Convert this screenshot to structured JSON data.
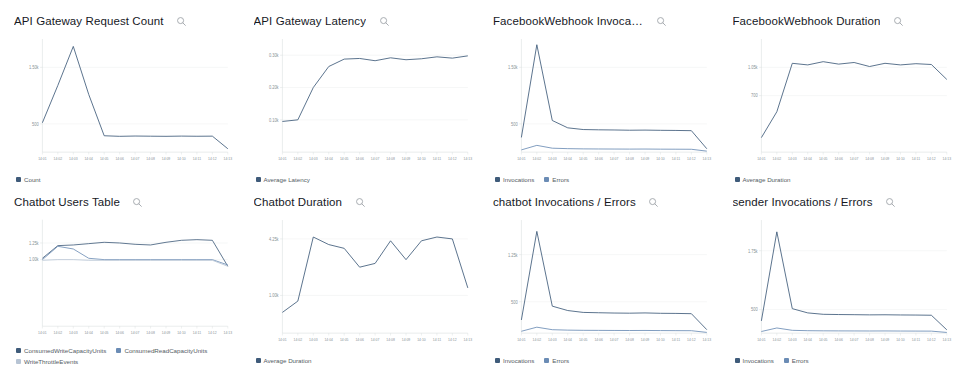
{
  "dashboard": {
    "search_icon": "search-icon",
    "palette": {
      "series1": "#3f5b7a",
      "series2": "#6b8cb5",
      "series3": "#b7c4d4",
      "legend_text": "#545b64",
      "gridline": "#eaeded",
      "axis_text": "#879196"
    },
    "widgets": [
      {
        "title": "API Gateway Request Count",
        "legend": [
          {
            "label": "Count",
            "color": "#3f5b7a"
          }
        ],
        "chart_data": {
          "type": "line",
          "title": "API Gateway Request Count",
          "xlabel": "",
          "ylabel": "",
          "grid": true,
          "legend_position": "bottom",
          "ylim": [
            0,
            2000
          ],
          "yticks": [
            500,
            1500
          ],
          "yticklabels": [
            "500",
            "1.50k"
          ],
          "x": [
            "14:01",
            "14:02",
            "14:03",
            "14:04",
            "14:05",
            "14:06",
            "14:07",
            "14:08",
            "14:09",
            "14:10",
            "14:11",
            "14:12",
            "14:13"
          ],
          "series": [
            {
              "name": "Count",
              "color": "#3f5b7a",
              "values": [
                520,
                1180,
                1870,
                1020,
                290,
                280,
                285,
                282,
                280,
                284,
                281,
                283,
                60
              ]
            }
          ]
        }
      },
      {
        "title": "API Gateway Latency",
        "legend": [
          {
            "label": "Average Latency",
            "color": "#3f5b7a"
          }
        ],
        "chart_data": {
          "type": "line",
          "title": "API Gateway Latency",
          "xlabel": "",
          "ylabel": "",
          "grid": true,
          "legend_position": "bottom",
          "ylim": [
            0,
            0.35
          ],
          "yticks": [
            0.1,
            0.2,
            0.3
          ],
          "yticklabels": [
            "0.10k",
            "0.20k",
            "0.30k"
          ],
          "x": [
            "14:01",
            "14:02",
            "14:03",
            "14:04",
            "14:05",
            "14:06",
            "14:07",
            "14:08",
            "14:09",
            "14:10",
            "14:11",
            "14:12",
            "14:13"
          ],
          "series": [
            {
              "name": "Average Latency",
              "color": "#3f5b7a",
              "values": [
                0.095,
                0.1,
                0.2,
                0.265,
                0.288,
                0.29,
                0.283,
                0.292,
                0.286,
                0.289,
                0.295,
                0.291,
                0.298
              ]
            }
          ]
        }
      },
      {
        "title": "FacebookWebhook Invocations / ...",
        "legend": [
          {
            "label": "Invocations",
            "color": "#3f5b7a"
          },
          {
            "label": "Errors",
            "color": "#6b8cb5"
          }
        ],
        "chart_data": {
          "type": "line",
          "title": "FacebookWebhook Invocations / Errors",
          "xlabel": "",
          "ylabel": "",
          "grid": true,
          "legend_position": "bottom",
          "ylim": [
            0,
            2000
          ],
          "yticks": [
            500,
            1500
          ],
          "yticklabels": [
            "500",
            "1.50k"
          ],
          "x": [
            "14:01",
            "14:02",
            "14:03",
            "14:04",
            "14:05",
            "14:06",
            "14:07",
            "14:08",
            "14:09",
            "14:10",
            "14:11",
            "14:12",
            "14:13"
          ],
          "series": [
            {
              "name": "Invocations",
              "color": "#3f5b7a",
              "values": [
                260,
                1900,
                560,
                430,
                400,
                395,
                392,
                388,
                390,
                386,
                384,
                380,
                60
              ]
            },
            {
              "name": "Errors",
              "color": "#6b8cb5",
              "values": [
                40,
                120,
                70,
                62,
                58,
                56,
                55,
                54,
                55,
                53,
                52,
                51,
                18
              ]
            }
          ]
        }
      },
      {
        "title": "FacebookWebhook Duration",
        "legend": [
          {
            "label": "Average Duration",
            "color": "#3f5b7a"
          }
        ],
        "chart_data": {
          "type": "line",
          "title": "FacebookWebhook Duration",
          "xlabel": "",
          "ylabel": "",
          "grid": true,
          "legend_position": "bottom",
          "ylim": [
            0,
            1400
          ],
          "yticks": [
            700,
            1050
          ],
          "yticklabels": [
            "700",
            "1.05k"
          ],
          "x": [
            "14:01",
            "14:02",
            "14:03",
            "14:04",
            "14:05",
            "14:06",
            "14:07",
            "14:08",
            "14:09",
            "14:10",
            "14:11",
            "14:12",
            "14:13"
          ],
          "series": [
            {
              "name": "Average Duration",
              "color": "#3f5b7a",
              "values": [
                180,
                500,
                1100,
                1080,
                1120,
                1090,
                1110,
                1060,
                1100,
                1080,
                1095,
                1085,
                900
              ]
            }
          ]
        }
      },
      {
        "title": "Chatbot Users Table",
        "legend": [
          {
            "label": "ConsumedWriteCapacityUnits",
            "color": "#3f5b7a"
          },
          {
            "label": "ConsumedReadCapacityUnits",
            "color": "#6b8cb5"
          },
          {
            "label": "WriteThrottleEvents",
            "color": "#b7c4d4"
          }
        ],
        "chart_data": {
          "type": "line",
          "title": "Chatbot Users Table",
          "xlabel": "",
          "ylabel": "",
          "grid": true,
          "legend_position": "bottom",
          "ylim": [
            0,
            1.6
          ],
          "yticks": [
            1.0,
            1.25
          ],
          "yticklabels": [
            "1.00k",
            "1.25k"
          ],
          "x": [
            "14:01",
            "14:02",
            "14:03",
            "14:04",
            "14:05",
            "14:06",
            "14:07",
            "14:08",
            "14:09",
            "14:10",
            "14:11",
            "14:12",
            "14:13"
          ],
          "series": [
            {
              "name": "ConsumedWriteCapacityUnits",
              "color": "#3f5b7a",
              "values": [
                1.02,
                1.21,
                1.22,
                1.24,
                1.26,
                1.25,
                1.23,
                1.22,
                1.26,
                1.29,
                1.3,
                1.29,
                0.9
              ]
            },
            {
              "name": "ConsumedReadCapacityUnits",
              "color": "#6b8cb5",
              "values": [
                1.0,
                1.2,
                1.16,
                1.02,
                1.0,
                1.0,
                1.0,
                1.0,
                1.0,
                1.0,
                1.0,
                1.0,
                0.92
              ]
            },
            {
              "name": "WriteThrottleEvents",
              "color": "#b7c4d4",
              "values": [
                0.99,
                1.0,
                1.0,
                0.99,
                0.99,
                0.99,
                0.99,
                0.99,
                0.99,
                0.99,
                0.99,
                0.99,
                0.9
              ]
            }
          ]
        }
      },
      {
        "title": "Chatbot Duration",
        "legend": [
          {
            "label": "Average Duration",
            "color": "#3f5b7a"
          }
        ],
        "chart_data": {
          "type": "line",
          "title": "Chatbot Duration",
          "xlabel": "",
          "ylabel": "",
          "grid": true,
          "legend_position": "bottom",
          "ylim": [
            0,
            0.3
          ],
          "yticks": [
            0.1,
            0.25
          ],
          "yticklabels": [
            "1.00k",
            "4.25k"
          ],
          "x": [
            "14:01",
            "14:02",
            "14:03",
            "14:04",
            "14:05",
            "14:06",
            "14:07",
            "14:08",
            "14:09",
            "14:10",
            "14:11",
            "14:12",
            "14:13"
          ],
          "series": [
            {
              "name": "Average Duration",
              "color": "#3f5b7a",
              "values": [
                0.055,
                0.085,
                0.255,
                0.235,
                0.225,
                0.175,
                0.185,
                0.245,
                0.195,
                0.245,
                0.255,
                0.25,
                0.12
              ]
            }
          ]
        }
      },
      {
        "title": "chatbot Invocations / Errors",
        "legend": [
          {
            "label": "Invocations",
            "color": "#3f5b7a"
          },
          {
            "label": "Errors",
            "color": "#6b8cb5"
          }
        ],
        "chart_data": {
          "type": "line",
          "title": "chatbot Invocations / Errors",
          "xlabel": "",
          "ylabel": "",
          "grid": true,
          "legend_position": "bottom",
          "ylim": [
            0,
            1800
          ],
          "yticks": [
            500,
            1250
          ],
          "yticklabels": [
            "500",
            "1.25k"
          ],
          "x": [
            "14:01",
            "14:02",
            "14:03",
            "14:04",
            "14:05",
            "14:06",
            "14:07",
            "14:08",
            "14:09",
            "14:10",
            "14:11",
            "14:12",
            "14:13"
          ],
          "series": [
            {
              "name": "Invocations",
              "color": "#3f5b7a",
              "values": [
                210,
                1620,
                430,
                360,
                330,
                325,
                320,
                318,
                322,
                316,
                314,
                310,
                55
              ]
            },
            {
              "name": "Errors",
              "color": "#6b8cb5",
              "values": [
                30,
                95,
                55,
                48,
                45,
                44,
                43,
                42,
                43,
                41,
                40,
                39,
                12
              ]
            }
          ]
        }
      },
      {
        "title": "sender Invocations / Errors",
        "legend": [
          {
            "label": "Invocations",
            "color": "#3f5b7a"
          },
          {
            "label": "Errors",
            "color": "#6b8cb5"
          }
        ],
        "chart_data": {
          "type": "line",
          "title": "sender Invocations / Errors",
          "xlabel": "",
          "ylabel": "",
          "grid": true,
          "legend_position": "bottom",
          "ylim": [
            0,
            2400
          ],
          "yticks": [
            500,
            1750
          ],
          "yticklabels": [
            "500",
            "1.75k"
          ],
          "x": [
            "14:01",
            "14:02",
            "14:03",
            "14:04",
            "14:05",
            "14:06",
            "14:07",
            "14:08",
            "14:09",
            "14:10",
            "14:11",
            "14:12",
            "14:13"
          ],
          "series": [
            {
              "name": "Invocations",
              "color": "#3f5b7a",
              "values": [
                260,
                2150,
                520,
                430,
                400,
                395,
                392,
                388,
                390,
                386,
                384,
                380,
                70
              ]
            },
            {
              "name": "Errors",
              "color": "#6b8cb5",
              "values": [
                35,
                110,
                60,
                52,
                49,
                48,
                47,
                46,
                47,
                45,
                44,
                43,
                15
              ]
            }
          ]
        }
      }
    ]
  }
}
